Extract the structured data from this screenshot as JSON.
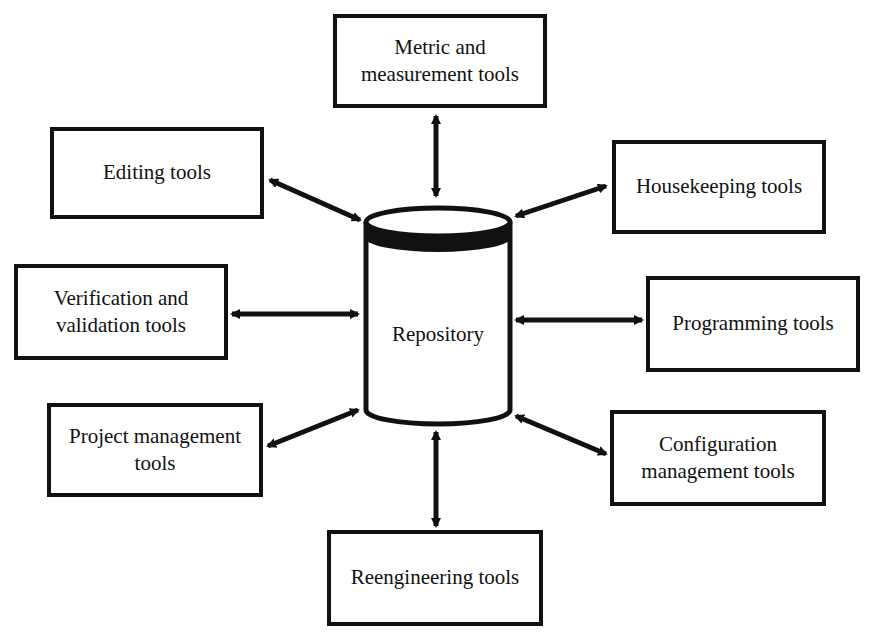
{
  "diagram": {
    "center": {
      "label": "Repository",
      "shape": "cylinder"
    },
    "tools": [
      {
        "id": "metric",
        "label": "Metric and\nmeasurement tools",
        "position": "top"
      },
      {
        "id": "editing",
        "label": "Editing tools",
        "position": "upper-left"
      },
      {
        "id": "housekeeping",
        "label": "Housekeeping tools",
        "position": "upper-right"
      },
      {
        "id": "verification",
        "label": "Verification and\nvalidation tools",
        "position": "left"
      },
      {
        "id": "programming",
        "label": "Programming tools",
        "position": "right"
      },
      {
        "id": "project",
        "label": "Project management\ntools",
        "position": "lower-left"
      },
      {
        "id": "configuration",
        "label": "Configuration\nmanagement tools",
        "position": "lower-right"
      },
      {
        "id": "reengineering",
        "label": "Reengineering tools",
        "position": "bottom"
      }
    ],
    "connection_type": "bidirectional-arrow",
    "colors": {
      "stroke": "#111111",
      "background": "#ffffff"
    }
  }
}
